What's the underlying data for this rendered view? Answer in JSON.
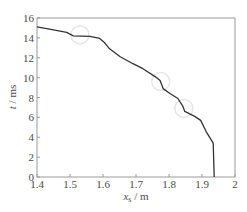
{
  "chart_data": {
    "type": "line",
    "title": "",
    "xlabel": "x_s / m",
    "xlabel_parts": {
      "var": "x",
      "sub": "s",
      "unit": " / m"
    },
    "ylabel": "t / ms",
    "ylabel_parts": {
      "var": "t",
      "unit": " / ms"
    },
    "xlim": [
      1.4,
      2.0
    ],
    "ylim": [
      0,
      16
    ],
    "x_ticks": [
      1.4,
      1.5,
      1.6,
      1.7,
      1.8,
      1.9,
      2.0
    ],
    "x_tick_labels": [
      "1.4",
      "1.5",
      "1.6",
      "1.7",
      "1.8",
      "1.9",
      "2"
    ],
    "y_ticks": [
      0,
      2,
      4,
      6,
      8,
      10,
      12,
      14,
      16
    ],
    "y_tick_labels": [
      "0",
      "2",
      "4",
      "6",
      "8",
      "10",
      "12",
      "14",
      "16"
    ],
    "grid": false,
    "legend": null,
    "series": [
      {
        "name": "trajectory",
        "color": "#333333",
        "x": [
          1.4,
          1.45,
          1.49,
          1.51,
          1.56,
          1.59,
          1.605,
          1.62,
          1.652,
          1.691,
          1.721,
          1.758,
          1.773,
          1.782,
          1.803,
          1.827,
          1.842,
          1.848,
          1.878,
          1.896,
          1.912,
          1.934,
          1.937
        ],
        "y": [
          15.1,
          14.8,
          14.55,
          14.2,
          14.15,
          13.95,
          13.5,
          12.9,
          12.1,
          11.4,
          10.9,
          10.1,
          9.7,
          8.9,
          8.4,
          7.9,
          7.1,
          6.6,
          6.1,
          5.7,
          4.6,
          3.4,
          0.0
        ]
      }
    ],
    "annotations": [
      {
        "type": "circle",
        "x": 1.53,
        "y": 14.3,
        "note": "faint highlight"
      },
      {
        "type": "circle",
        "x": 1.775,
        "y": 9.6,
        "note": "faint highlight"
      },
      {
        "type": "circle",
        "x": 1.845,
        "y": 6.9,
        "note": "faint highlight"
      }
    ]
  },
  "style": {
    "axis_color": "#9a9a9a",
    "line_color": "#333333",
    "annotation_color": "#e6e6e6"
  }
}
